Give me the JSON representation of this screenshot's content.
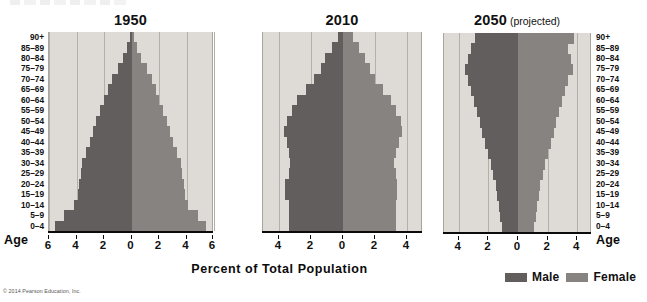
{
  "figure": {
    "xaxis_title": "Percent of Total Population",
    "age_axis_label": "Age",
    "credit": "© 2014 Pearson Education, Inc."
  },
  "legend": {
    "position": "bottom-right",
    "items": [
      {
        "label": "Male",
        "color": "#615e5d",
        "swatch": "male-swatch"
      },
      {
        "label": "Female",
        "color": "#868381",
        "swatch": "female-swatch"
      }
    ]
  },
  "age_groups": [
    "90+",
    "85–89",
    "80–84",
    "75–79",
    "70–74",
    "65–69",
    "60–64",
    "55–59",
    "50–54",
    "45–49",
    "40–44",
    "35–39",
    "30–34",
    "25–29",
    "20–24",
    "15–19",
    "10–14",
    "5–9",
    "0–4"
  ],
  "chart_data": {
    "type": "bar",
    "subtype": "population-pyramid",
    "title": "Percent of Total Population",
    "xlabel": "Percent of Total Population",
    "ylabel": "Age",
    "grid": true,
    "legend_position": "bottom-right",
    "categories": [
      "0–4",
      "5–9",
      "10–14",
      "15–19",
      "20–24",
      "25–29",
      "30–34",
      "35–39",
      "40–44",
      "45–49",
      "50–54",
      "55–59",
      "60–64",
      "65–69",
      "70–74",
      "75–79",
      "80–84",
      "85–89",
      "90+"
    ],
    "panels": [
      {
        "title": "1950",
        "subtitle": "",
        "xlim": [
          -6,
          6
        ],
        "xticks": [
          -6,
          -4,
          -2,
          0,
          2,
          4,
          6
        ],
        "xticklabels": [
          "6",
          "4",
          "2",
          "0",
          "2",
          "4",
          "6"
        ],
        "series": [
          {
            "name": "Male",
            "color": "#615e5d",
            "values": [
              5.6,
              4.9,
              4.2,
              3.9,
              3.8,
              3.7,
              3.6,
              3.3,
              3.0,
              2.8,
              2.6,
              2.3,
              2.0,
              1.7,
              1.4,
              1.0,
              0.6,
              0.3,
              0.1
            ]
          },
          {
            "name": "Female",
            "color": "#868381",
            "values": [
              5.4,
              4.8,
              4.1,
              3.9,
              3.8,
              3.7,
              3.6,
              3.3,
              3.0,
              2.8,
              2.6,
              2.3,
              2.0,
              1.8,
              1.5,
              1.1,
              0.7,
              0.4,
              0.15
            ]
          }
        ]
      },
      {
        "title": "2010",
        "subtitle": "",
        "xlim": [
          -5,
          5
        ],
        "xticks": [
          -4,
          -2,
          0,
          2,
          4
        ],
        "xticklabels": [
          "4",
          "2",
          "0",
          "2",
          "4"
        ],
        "series": [
          {
            "name": "Male",
            "color": "#615e5d",
            "values": [
              3.4,
              3.4,
              3.4,
              3.6,
              3.6,
              3.4,
              3.3,
              3.4,
              3.5,
              3.7,
              3.5,
              3.2,
              2.9,
              2.3,
              1.8,
              1.4,
              1.1,
              0.7,
              0.3
            ]
          },
          {
            "name": "Female",
            "color": "#868381",
            "values": [
              3.3,
              3.3,
              3.3,
              3.4,
              3.4,
              3.3,
              3.2,
              3.3,
              3.5,
              3.7,
              3.6,
              3.3,
              3.0,
              2.5,
              2.0,
              1.7,
              1.4,
              1.0,
              0.6
            ]
          }
        ]
      },
      {
        "title": "2050",
        "subtitle": "(projected)",
        "xlim": [
          -5,
          5
        ],
        "xticks": [
          -4,
          -2,
          0,
          2,
          4
        ],
        "xticklabels": [
          "4",
          "2",
          "0",
          "2",
          "4"
        ],
        "series": [
          {
            "name": "Male",
            "color": "#615e5d",
            "values": [
              1.1,
              1.2,
              1.3,
              1.4,
              1.5,
              1.7,
              1.8,
              2.0,
              2.2,
              2.4,
              2.6,
              2.8,
              3.0,
              3.2,
              3.4,
              3.6,
              3.4,
              3.2,
              2.9
            ]
          },
          {
            "name": "Female",
            "color": "#868381",
            "values": [
              1.1,
              1.2,
              1.3,
              1.4,
              1.5,
              1.7,
              1.8,
              2.0,
              2.2,
              2.4,
              2.6,
              2.8,
              3.0,
              3.2,
              3.4,
              3.7,
              3.6,
              3.4,
              3.8
            ]
          }
        ]
      }
    ]
  }
}
